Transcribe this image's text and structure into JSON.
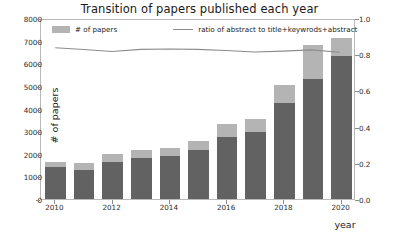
{
  "chart_data": {
    "type": "bar",
    "title": "Transition of papers published each year",
    "xlabel": "year",
    "ylabel": "# of papers",
    "ylabel_right": "ratio of abstract to title+keywrods+abstract",
    "categories": [
      "2010",
      "2011",
      "2012",
      "2013",
      "2014",
      "2015",
      "2016",
      "2017",
      "2018",
      "2019",
      "2020"
    ],
    "xtick_labels": [
      "2010",
      "2012",
      "2014",
      "2016",
      "2018",
      "2020"
    ],
    "ylim": [
      0,
      8000
    ],
    "ytick_labels": [
      "0",
      "1000",
      "2000",
      "3000",
      "4000",
      "5000",
      "6000",
      "7000",
      "8000"
    ],
    "ytick_values": [
      0,
      1000,
      2000,
      3000,
      4000,
      5000,
      6000,
      7000,
      8000
    ],
    "ylim_right": [
      0,
      1.0
    ],
    "ytick_labels_right": [
      "0.0",
      "0.2",
      "0.4",
      "0.6",
      "0.8",
      "1.0"
    ],
    "ytick_values_right": [
      0,
      0.2,
      0.4,
      0.6,
      0.8,
      1.0
    ],
    "grid": false,
    "legend_position": "upper-left-and-center",
    "series": [
      {
        "name": "# of papers",
        "kind": "bar",
        "color": "#b4b4b4",
        "stacked": true,
        "values": [
          1650,
          1600,
          2000,
          2150,
          2250,
          2550,
          3300,
          3550,
          5050,
          6800,
          7550
        ]
      },
      {
        "name": "# of papers with abstract",
        "kind": "bar-segment-bottom",
        "color": "#626262",
        "values": [
          1400,
          1300,
          1650,
          1800,
          1900,
          2150,
          2750,
          2950,
          4250,
          5300,
          6300
        ]
      },
      {
        "name": "ratio of abstract to title+keywrods+abstract",
        "kind": "line",
        "color": "#8c8c8c",
        "axis": "right",
        "values": [
          0.845,
          0.835,
          0.824,
          0.836,
          0.838,
          0.836,
          0.83,
          0.821,
          0.826,
          0.833,
          0.82
        ]
      }
    ]
  },
  "legend": {
    "bar_label": "# of papers",
    "line_label": "ratio of abstract to title+keywrods+abstract"
  }
}
